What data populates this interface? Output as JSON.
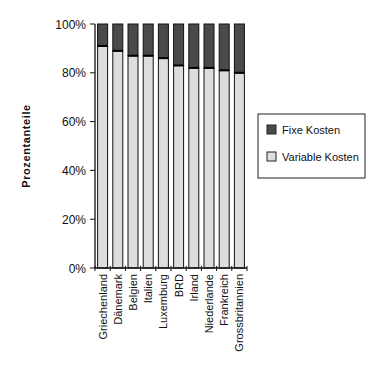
{
  "chart_data": {
    "type": "bar",
    "stacked": true,
    "orientation": "vertical",
    "title": "",
    "xlabel": "",
    "ylabel": "Prozentanteile",
    "ylim": [
      0,
      100
    ],
    "yticks": [
      "0%",
      "20%",
      "40%",
      "60%",
      "80%",
      "100%"
    ],
    "grid": false,
    "legend_position": "right",
    "categories": [
      "Griechenland",
      "Dänemark",
      "Belgien",
      "Italien",
      "Luxemburg",
      "BRD",
      "Irland",
      "Niederlande",
      "Frankreich",
      "Grossbritannien"
    ],
    "series": [
      {
        "name": "Variable Kosten",
        "color": "#dddddd",
        "values": [
          91,
          89,
          87,
          87,
          86,
          83,
          82,
          82,
          81,
          80
        ]
      },
      {
        "name": "Fixe Kosten",
        "color": "#4a4a4a",
        "values": [
          9,
          11,
          13,
          13,
          14,
          17,
          18,
          18,
          19,
          20
        ]
      }
    ]
  },
  "legend": {
    "items": [
      {
        "label": "Fixe Kosten",
        "color": "#4a4a4a"
      },
      {
        "label": "Variable Kosten",
        "color": "#dddddd"
      }
    ]
  }
}
